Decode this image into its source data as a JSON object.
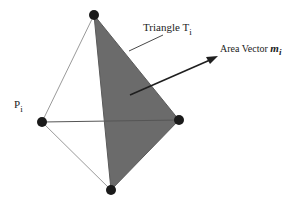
{
  "diagram": {
    "type": "tetrahedron-area-vector",
    "colors": {
      "background": "#ffffff",
      "face_fill": "#6b6b6b",
      "edge": "#9a9a9a",
      "vertex": "#1a1a1a",
      "arrow": "#1f1f1f",
      "text": "#222222"
    },
    "vertices": {
      "top": {
        "x": 94,
        "y": 15
      },
      "left": {
        "x": 42,
        "y": 122
      },
      "right": {
        "x": 179,
        "y": 120
      },
      "bottom": {
        "x": 111,
        "y": 190
      }
    },
    "shaded_face": [
      "top",
      "right",
      "bottom"
    ],
    "edges": [
      [
        "top",
        "left"
      ],
      [
        "left",
        "bottom"
      ],
      [
        "left",
        "right"
      ],
      [
        "top",
        "right"
      ],
      [
        "top",
        "bottom"
      ],
      [
        "right",
        "bottom"
      ]
    ],
    "arrow": {
      "from": {
        "x": 130,
        "y": 95
      },
      "to": {
        "x": 217,
        "y": 57
      }
    },
    "leader_line": {
      "from": {
        "x": 163,
        "y": 35
      },
      "to": {
        "x": 129,
        "y": 51
      }
    },
    "labels": {
      "triangle": {
        "text": "Triangle T",
        "sub": "i"
      },
      "area_vector": {
        "text": "Area Vector ",
        "symbol": "m",
        "sub": "i"
      },
      "point": {
        "text": "P",
        "sub": "i"
      }
    }
  }
}
